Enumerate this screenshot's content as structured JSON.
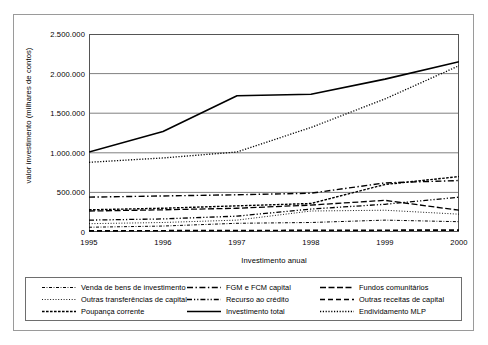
{
  "chart_data": {
    "type": "line",
    "title": "",
    "xlabel": "Investimento anual",
    "ylabel": "valor investimento (milhares de contos)",
    "x": [
      1995,
      1996,
      1997,
      1998,
      1999,
      2000
    ],
    "xticklabels": [
      "1995",
      "1996",
      "1997",
      "1998",
      "1999",
      "2000"
    ],
    "yticks": [
      0,
      500000,
      1000000,
      1500000,
      2000000,
      2500000
    ],
    "yticklabels": [
      "0",
      "500.000",
      "1.000.000",
      "1.500.000",
      "2.000.000",
      "2.500.000"
    ],
    "ylim": [
      0,
      2500000
    ],
    "grid": "horizontal",
    "legend_position": "bottom",
    "series": [
      {
        "name": "Venda de bens de investimento",
        "style": "dotted-marker",
        "values": [
          60000,
          75000,
          110000,
          120000,
          150000,
          130000
        ]
      },
      {
        "name": "FGM e FCM capital",
        "style": "dash-dot",
        "values": [
          440000,
          455000,
          470000,
          490000,
          620000,
          650000
        ]
      },
      {
        "name": "Fundos comunitários",
        "style": "dash-long",
        "values": [
          265000,
          280000,
          300000,
          340000,
          400000,
          275000
        ]
      },
      {
        "name": "Outras transferências de capital",
        "style": "fine-dotted",
        "values": [
          105000,
          120000,
          150000,
          265000,
          275000,
          225000
        ]
      },
      {
        "name": "Recurso ao crédito",
        "style": "dash-dot-dot",
        "values": [
          150000,
          165000,
          200000,
          290000,
          350000,
          440000
        ]
      },
      {
        "name": "Outras receitas de capital",
        "style": "dashed-thick",
        "values": [
          15000,
          16000,
          18000,
          20000,
          22000,
          24000
        ]
      },
      {
        "name": "Poupança corrente",
        "style": "short-dash",
        "values": [
          280000,
          300000,
          330000,
          360000,
          600000,
          700000
        ]
      },
      {
        "name": "Investimento total",
        "style": "solid",
        "values": [
          1010000,
          1270000,
          1720000,
          1740000,
          1930000,
          2150000
        ]
      },
      {
        "name": "Endividamento MLP",
        "style": "dotted",
        "values": [
          880000,
          935000,
          1010000,
          1320000,
          1680000,
          2100000
        ]
      }
    ]
  },
  "legend": {
    "items": [
      {
        "label": "Venda de bens de investimento",
        "swatch": "dotted-marker"
      },
      {
        "label": "FGM e FCM capital",
        "swatch": "dash-dot"
      },
      {
        "label": "Fundos comunitários",
        "swatch": "dash-long"
      },
      {
        "label": "Outras transferências de capital",
        "swatch": "fine-dotted"
      },
      {
        "label": "Recurso ao crédito",
        "swatch": "dash-dot-dot"
      },
      {
        "label": "Outras receitas de capital",
        "swatch": "dashed-thick"
      },
      {
        "label": "Poupança corrente",
        "swatch": "short-dash"
      },
      {
        "label": "Investimento total",
        "swatch": "solid"
      },
      {
        "label": "Endividamento MLP",
        "swatch": "dotted"
      }
    ]
  },
  "colors": {
    "line": "#000000",
    "grid": "#808080",
    "border": "#9a9a9a",
    "background": "#ffffff"
  }
}
